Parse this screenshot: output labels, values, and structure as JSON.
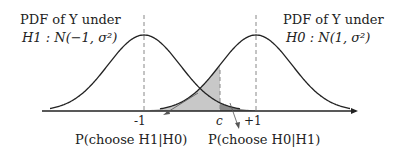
{
  "title_left": {
    "line1": "PDF of Y under",
    "line2": "H1 : N(−1, σ²)"
  },
  "title_right": {
    "line1": "PDF of Y under",
    "line2": "H0 : N(1, σ²)"
  },
  "ticks": {
    "minus1": "-1",
    "c": "c",
    "plus1": "+1"
  },
  "annotations": {
    "type1": "P(choose H1|H0)",
    "type2": "P(choose H0|H1)"
  },
  "distributions": [
    {
      "name": "H1",
      "mean": -1,
      "variance_symbol": "σ²"
    },
    {
      "name": "H0",
      "mean": 1,
      "variance_symbol": "σ²"
    }
  ],
  "colors": {
    "light_shade": "#c8c8c8",
    "dark_shade": "#8a8a8a",
    "curve": "#222222"
  }
}
